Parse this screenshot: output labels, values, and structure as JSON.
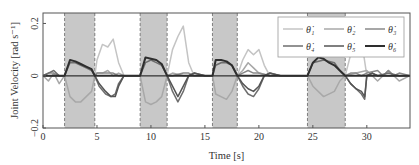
{
  "chart_data": {
    "type": "line",
    "title": "",
    "xlabel": "Time [s]",
    "ylabel": "Joint Velocity [rad s⁻¹]",
    "xlim": [
      0,
      34
    ],
    "ylim": [
      -0.2,
      0.24
    ],
    "xticks": [
      0,
      5,
      10,
      15,
      20,
      25,
      30
    ],
    "xtick_labels": [
      "0",
      "5",
      "10",
      "15",
      "20",
      "25",
      "30"
    ],
    "yticks": [
      -0.2,
      0,
      0.2
    ],
    "ytick_labels": [
      "−0.2",
      "0",
      "0.2"
    ],
    "grid": false,
    "legend_position": "top-right",
    "shaded_regions": [
      [
        2.0,
        4.8
      ],
      [
        9.0,
        11.5
      ],
      [
        15.7,
        18.0
      ],
      [
        24.5,
        28.0
      ]
    ],
    "series": [
      {
        "name": "θ̇₁",
        "color": "#c4c4c4",
        "x": [
          0,
          1,
          2,
          2.5,
          3.5,
          4.5,
          4.8,
          5,
          5.5,
          6,
          6.5,
          7,
          7.5,
          8,
          9,
          9.5,
          10.5,
          11.2,
          11.5,
          12,
          12.5,
          13,
          13.5,
          14,
          15,
          15.7,
          16.5,
          17.5,
          18,
          18.5,
          19,
          19.5,
          20,
          20.5,
          21,
          22,
          24.5,
          25,
          26,
          27,
          28,
          28.5,
          29,
          29.5,
          30,
          31,
          32,
          33,
          34
        ],
        "y": [
          0,
          0,
          0,
          0,
          0,
          0,
          0,
          0.06,
          0.12,
          0.11,
          0.14,
          0.05,
          0,
          0,
          0,
          0,
          0,
          0,
          0,
          0.1,
          0.15,
          0.19,
          0.05,
          0,
          0,
          0,
          0,
          0,
          0,
          0.06,
          0.1,
          0.08,
          0.1,
          0.04,
          0,
          0,
          0,
          0,
          0,
          0,
          0,
          0.08,
          0.1,
          0.14,
          0,
          0,
          0,
          0,
          0
        ]
      },
      {
        "name": "θ̇₂",
        "color": "#a8a8a8",
        "x": [
          0,
          0.5,
          1,
          1.5,
          2,
          2.5,
          3,
          3.5,
          4,
          4.5,
          4.8,
          5,
          5.5,
          6,
          6.5,
          7,
          7.5,
          8,
          9,
          9.5,
          10,
          10.5,
          11,
          11.5,
          12,
          13,
          14,
          15,
          15.7,
          16,
          17,
          17.5,
          18,
          18.5,
          19,
          19.5,
          20,
          21,
          22,
          24.5,
          25,
          26,
          27,
          27.5,
          28,
          29,
          30,
          31,
          32,
          33,
          34
        ],
        "y": [
          0,
          -0.02,
          0.01,
          -0.03,
          0,
          -0.08,
          -0.1,
          -0.1,
          -0.08,
          -0.06,
          0,
          0.01,
          0.01,
          0.02,
          0,
          0.01,
          0,
          0,
          0,
          -0.1,
          -0.11,
          -0.1,
          -0.08,
          0,
          0.01,
          0,
          0,
          0,
          0,
          -0.07,
          -0.09,
          -0.06,
          0,
          0.02,
          0.05,
          0.03,
          0.01,
          0,
          0,
          0,
          -0.04,
          -0.08,
          -0.06,
          -0.02,
          0,
          0.01,
          0.02,
          -0.02,
          0.02,
          -0.02,
          0
        ]
      },
      {
        "name": "θ̇₃",
        "color": "#8a8a8a",
        "x": [
          0,
          0.5,
          1,
          1.5,
          2,
          4.8,
          5,
          5.5,
          6,
          6.5,
          7,
          7.5,
          8,
          9,
          11.5,
          12,
          13,
          13.5,
          14,
          15,
          15.7,
          18,
          18.5,
          19,
          19.5,
          20,
          21,
          22,
          24.5,
          28,
          28.5,
          29,
          29.5,
          30,
          31,
          31.5,
          32,
          32.5,
          33,
          34
        ],
        "y": [
          0,
          0.01,
          0.01,
          0,
          0,
          0,
          0.01,
          0.01,
          0.01,
          0.01,
          0,
          0,
          0,
          0,
          0,
          0,
          0.01,
          0.01,
          0,
          0,
          0,
          0,
          0.01,
          0.02,
          0.01,
          0.01,
          0,
          0,
          0,
          0,
          0.01,
          0.01,
          0,
          0.01,
          0.02,
          0,
          0.02,
          0,
          0.01,
          0
        ]
      },
      {
        "name": "θ̇₄",
        "color": "#6e6e6e",
        "x": [
          0,
          0.5,
          1,
          1.5,
          2,
          2.5,
          3,
          3.5,
          4,
          4.5,
          4.8,
          5.2,
          5.8,
          6.3,
          6.7,
          7,
          7.5,
          8,
          9,
          9.5,
          10,
          10.5,
          11,
          11.5,
          12,
          12.5,
          13,
          13.5,
          14,
          15,
          15.7,
          16,
          16.5,
          17,
          17.5,
          18,
          18.5,
          19,
          19.5,
          20,
          20.5,
          21,
          22,
          24.5,
          25,
          26,
          27,
          27.5,
          28,
          28.5,
          29,
          29.5,
          29.8,
          30,
          30.5,
          31,
          32,
          33,
          34
        ],
        "y": [
          0,
          0.01,
          0.02,
          0,
          0,
          0.05,
          0.05,
          0.04,
          0.03,
          0.02,
          0,
          -0.04,
          -0.07,
          -0.08,
          -0.07,
          -0.03,
          0,
          0,
          0,
          0.05,
          0.06,
          0.05,
          0.04,
          0,
          -0.06,
          -0.1,
          -0.06,
          0,
          0.01,
          0,
          0,
          0.04,
          0.05,
          0.05,
          0.04,
          0,
          -0.04,
          -0.07,
          -0.08,
          -0.05,
          0,
          0.01,
          0,
          0,
          0.05,
          0.06,
          0.05,
          0.02,
          0,
          -0.03,
          -0.05,
          -0.07,
          -0.09,
          0,
          0.01,
          0,
          0.01,
          0,
          0
        ]
      },
      {
        "name": "θ̇₅",
        "color": "#555555",
        "x": [
          0,
          1,
          2,
          4.8,
          5.2,
          5.8,
          6.3,
          6.7,
          7,
          7.5,
          8,
          9,
          11.5,
          12,
          12.5,
          13,
          13.5,
          14,
          15,
          15.7,
          18,
          18.5,
          19,
          19.5,
          20,
          20.5,
          21,
          22,
          24.5,
          28,
          28.5,
          29,
          29.5,
          29.8,
          30,
          30.5,
          31,
          32,
          33,
          34
        ],
        "y": [
          0,
          0,
          0,
          0,
          -0.03,
          -0.06,
          -0.08,
          -0.08,
          -0.04,
          0,
          0,
          0,
          0,
          -0.04,
          -0.08,
          -0.04,
          0,
          0.01,
          0,
          0,
          0,
          -0.03,
          -0.05,
          -0.06,
          -0.04,
          0,
          0.01,
          0,
          0,
          0,
          -0.03,
          -0.05,
          -0.06,
          -0.08,
          0,
          0.01,
          0,
          0,
          0,
          0
        ]
      },
      {
        "name": "θ̇₆",
        "color": "#2e2e2e",
        "x": [
          0,
          2,
          2.5,
          3,
          3.5,
          4,
          4.5,
          4.8,
          5,
          9,
          9.5,
          10,
          10.5,
          11,
          11.5,
          12,
          15.7,
          16,
          16.5,
          17,
          17.5,
          18,
          18.5,
          24.5,
          25,
          25.5,
          26,
          26.5,
          27,
          27.5,
          28,
          28.5,
          34
        ],
        "y": [
          0,
          0,
          0.06,
          0.055,
          0.045,
          0.035,
          0.025,
          0,
          0,
          0,
          0.07,
          0.065,
          0.06,
          0.045,
          0,
          0,
          0,
          0.06,
          0.06,
          0.055,
          0.04,
          0,
          0,
          0,
          0.05,
          0.07,
          0.065,
          0.05,
          0.04,
          0.02,
          0,
          0,
          0
        ]
      }
    ]
  }
}
